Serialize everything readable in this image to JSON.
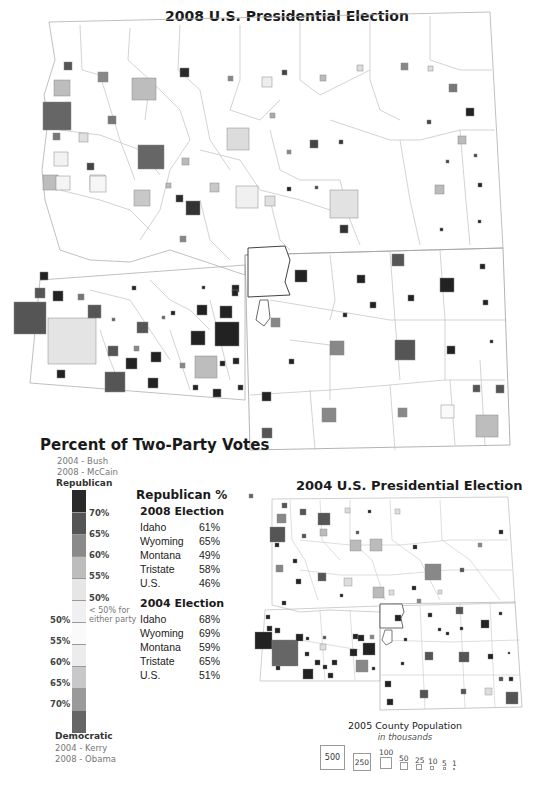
{
  "map_2008": {
    "title": "2008 U.S. Presidential Election"
  },
  "map_2004": {
    "title": "2004 U.S. Presidential Election"
  },
  "legend": {
    "title": "Percent of Two-Party Votes",
    "rep_line1": "2004 - Bush",
    "rep_line2": "2008 - McCain",
    "rep_label": "Republican",
    "dem_label": "Democratic",
    "dem_line1": "2004 - Kerry",
    "dem_line2": "2008 - Obama",
    "rep_ticks": [
      "70%",
      "65%",
      "60%",
      "55%",
      "50%"
    ],
    "under_note_1": "< 50% for",
    "under_note_2": "either party",
    "dem_ticks": [
      "50%",
      "55%",
      "60%",
      "65%",
      "70%"
    ],
    "colors": {
      "rep": [
        "#2a2a2a",
        "#555555",
        "#8a8a8a",
        "#bdbdbd",
        "#e6e6e6"
      ],
      "mid": "#f0f0f0",
      "dem": [
        "#fafafa",
        "#ececec",
        "#c8c8c8",
        "#9a9a9a",
        "#666666"
      ]
    }
  },
  "stats": {
    "heading": "Republican %",
    "e2008": {
      "label": "2008 Election",
      "rows": [
        {
          "name": "Idaho",
          "value": "61%"
        },
        {
          "name": "Wyoming",
          "value": "65%"
        },
        {
          "name": "Montana",
          "value": "49%"
        },
        {
          "name": "Tristate",
          "value": "58%"
        },
        {
          "name": "U.S.",
          "value": "46%"
        }
      ]
    },
    "e2004": {
      "label": "2004 Election",
      "rows": [
        {
          "name": "Idaho",
          "value": "68%"
        },
        {
          "name": "Wyoming",
          "value": "69%"
        },
        {
          "name": "Montana",
          "value": "59%"
        },
        {
          "name": "Tristate",
          "value": "65%"
        },
        {
          "name": "U.S.",
          "value": "51%"
        }
      ]
    }
  },
  "population_legend": {
    "title": "2005 County Population",
    "subtitle": "in thousands",
    "sizes": [
      "500",
      "250",
      "100",
      "50",
      "25",
      "10",
      "5",
      "1"
    ]
  }
}
